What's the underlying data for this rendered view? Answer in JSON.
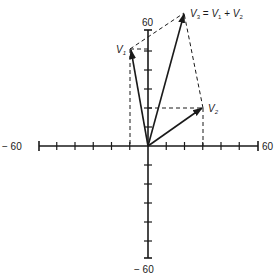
{
  "diagram": {
    "type": "vector-addition",
    "x_axis": {
      "min": -60,
      "max": 60,
      "tick_step": 10,
      "min_label": "− 60",
      "max_label": "60"
    },
    "y_axis": {
      "min": -60,
      "max": 60,
      "tick_step": 10,
      "max_label": "60",
      "min_label": "− 60"
    },
    "vectors": [
      {
        "name": "V1",
        "label": "V",
        "sub": "1",
        "x": -10,
        "y": 50
      },
      {
        "name": "V2",
        "label": "V",
        "sub": "2",
        "x": 30,
        "y": 20
      },
      {
        "name": "V3",
        "label": "V",
        "sub": "3",
        "x": 20,
        "y": 70
      }
    ],
    "equation": {
      "lhs": "V",
      "lhs_sub": "3",
      "eq": " = ",
      "a": "V",
      "a_sub": "1",
      "plus": " + ",
      "b": "V",
      "b_sub": "2"
    },
    "colors": {
      "line": "#1a1a1a",
      "background": "#ffffff"
    }
  }
}
